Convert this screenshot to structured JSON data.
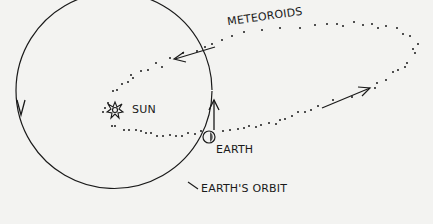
{
  "diagram": {
    "type": "orbit-illustration",
    "colors": {
      "background": "#f3f3f1",
      "ink": "#1a1a1a"
    },
    "labels": {
      "meteoroids": "METEOROIDS",
      "sun": "SUN",
      "earth": "EARTH",
      "earths_orbit": "EARTH'S ORBIT"
    },
    "elements": [
      {
        "id": "earth-orbit",
        "shape": "circle",
        "direction": "counterclockwise arrows"
      },
      {
        "id": "meteoroid-stream",
        "shape": "dotted elongated ellipse",
        "direction": "arrows indicating travel"
      },
      {
        "id": "sun",
        "shape": "star-burst"
      },
      {
        "id": "earth",
        "shape": "small shaded circle on orbit"
      }
    ]
  }
}
